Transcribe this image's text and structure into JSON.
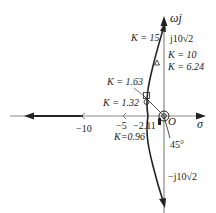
{
  "diagram": {
    "type": "root-locus",
    "axes": {
      "real_label": "σ",
      "imag_label": "ωj"
    },
    "origin_label": "O",
    "real_ticks": {
      "minus10": "−10",
      "minus5": "−5",
      "breakaway": "−2.11"
    },
    "imag_ticks": {
      "upper": "j10√2",
      "lower": "−j10√2"
    },
    "gain_labels": {
      "k15": "K = 15",
      "k10": "K = 10",
      "k624": "K = 6.24",
      "k163": "K = 1.63",
      "k132": "K = 1.32",
      "k096": "K=0.96"
    },
    "angle_label": "45°",
    "colors": {
      "axis": "#8a8a8a",
      "locus": "#222222",
      "text": "#222222"
    }
  }
}
